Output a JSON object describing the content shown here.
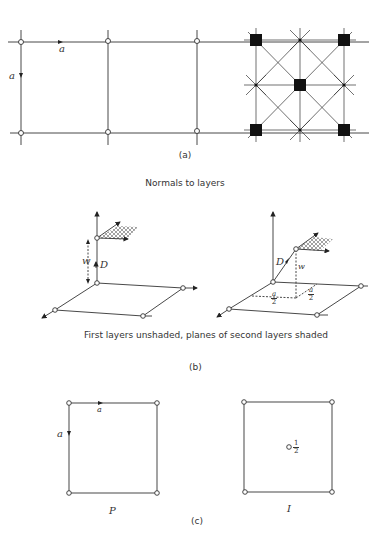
{
  "panel_a": {
    "caption": "(a)",
    "left_label_horizontal": "a",
    "left_label_vertical": "a"
  },
  "panel_b": {
    "title": "Normals to layers",
    "caption": "(b)",
    "subtitle": "First layers unshaded, planes of second layers shaded",
    "left": {
      "label_w": "w",
      "label_D": "D"
    },
    "right": {
      "label_w": "w",
      "label_D": "D",
      "frac1_num": "a",
      "frac1_den": "2",
      "frac2_num": "a",
      "frac2_den": "2"
    }
  },
  "panel_c": {
    "caption": "(c)",
    "left": {
      "label_horizontal": "a",
      "label_vertical": "a",
      "name": "P"
    },
    "right": {
      "center_num": "1",
      "center_den": "2",
      "name": "I"
    }
  },
  "colors": {
    "line": "#333333",
    "background": "#ffffff",
    "fill": "#111111"
  }
}
